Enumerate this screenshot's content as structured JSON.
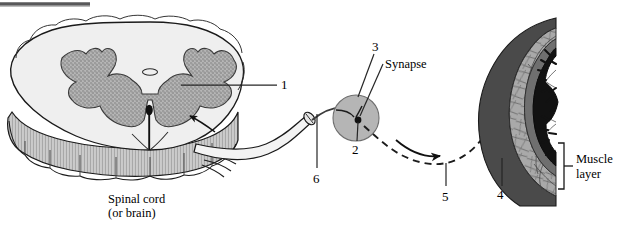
{
  "figure": {
    "type": "anatomical-diagram",
    "background_color": "#ffffff",
    "top_rule_color": "#58585a"
  },
  "palette": {
    "white_matter": "#efefef",
    "gray_matter": "#a8a8a8",
    "outline": "#1a1a1a",
    "synapse_fill": "#b5b5b5",
    "muscle_light": "#a9a9a9",
    "muscle_mid": "#7c7c7c",
    "muscle_dark": "#4a4a4a",
    "mucosa_black": "#121212",
    "leader_line": "#262626"
  },
  "labels": {
    "callouts": [
      {
        "id": "1",
        "text": "1",
        "x": 281,
        "y": 78,
        "target": "gray-matter-ventral-horn"
      },
      {
        "id": "2",
        "text": "2",
        "x": 352,
        "y": 148,
        "target": "synapse-terminal-knob"
      },
      {
        "id": "3",
        "text": "3",
        "x": 372,
        "y": 44,
        "target": "synapse-region"
      },
      {
        "id": "4",
        "text": "4",
        "x": 497,
        "y": 190,
        "target": "muscle-layer-fibers"
      },
      {
        "id": "5",
        "text": "5",
        "x": 442,
        "y": 193,
        "target": "postganglionic-pathway"
      },
      {
        "id": "6",
        "text": "6",
        "x": 313,
        "y": 175,
        "target": "preganglionic-axon"
      }
    ],
    "texts": [
      {
        "id": "synapse",
        "text": "Synapse",
        "x": 385,
        "y": 63,
        "align": "left"
      },
      {
        "id": "muscle-layer",
        "text": "Muscle",
        "x": 578,
        "y": 162,
        "align": "left"
      },
      {
        "id": "muscle-layer2",
        "text": "layer",
        "x": 578,
        "y": 177,
        "align": "left"
      },
      {
        "id": "spinal-cord",
        "text": "Spinal cord",
        "x": 108,
        "y": 200,
        "align": "left"
      },
      {
        "id": "spinal-cord2",
        "text": "(or brain)",
        "x": 108,
        "y": 214,
        "align": "left"
      }
    ]
  },
  "structures": {
    "spinal_cord": {
      "name": "Spinal cord (or brain)",
      "caption": "Spinal cord\n(or brain)"
    },
    "synapse": {
      "name": "Synapse",
      "caption": "Synapse"
    },
    "muscle": {
      "name": "Muscle layer",
      "caption": "Muscle\nlayer"
    }
  }
}
